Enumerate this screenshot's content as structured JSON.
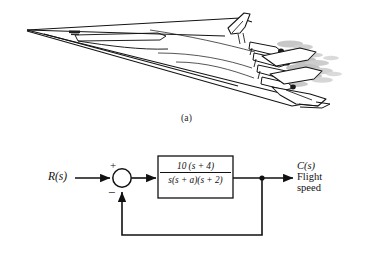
{
  "figure": {
    "panel_a": {
      "caption": "(a)",
      "subject": "flying-wing bomber aircraft line drawing",
      "marking": "fuselage-decal"
    },
    "panel_b": {
      "caption": "(b)",
      "type": "feedback-control-block-diagram",
      "input_label": "R(s)",
      "summing_junction": {
        "positive_sign": "+",
        "negative_sign": "−"
      },
      "transfer_function": {
        "numerator": "10 (s + 4)",
        "denominator": "s(s + a)(s + 2)"
      },
      "output": {
        "symbol": "C(s)",
        "description_line1": "Flight",
        "description_line2": "speed"
      }
    }
  },
  "colors": {
    "ink": "#111111",
    "line": "#1a1a1a",
    "background": "#ffffff",
    "shade": "#8a8a8a",
    "decal": "#202020"
  }
}
